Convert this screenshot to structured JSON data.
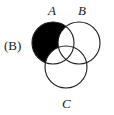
{
  "figure": {
    "panel_label": "(B)",
    "kind": "venn-diagram-three-set",
    "background_color": "#ffffff",
    "stroke_color": "#1a1a1a",
    "shaded_color": "#000000",
    "stroke_width": 1.1
  },
  "sets": [
    {
      "id": "A",
      "label": "A",
      "cx": 53,
      "cy": 43,
      "r": 21
    },
    {
      "id": "B",
      "label": "B",
      "cx": 79,
      "cy": 43,
      "r": 21
    },
    {
      "id": "C",
      "label": "C",
      "cx": 66,
      "cy": 67,
      "r": 21
    }
  ],
  "shading": {
    "region_expression": "A \\ (B ∪ C)",
    "description": "Only the part of circle A outside both B and C is filled solid black.",
    "fill": "#000000"
  },
  "labels": {
    "panel": "(B)",
    "a": "A",
    "b": "B",
    "c": "C"
  }
}
